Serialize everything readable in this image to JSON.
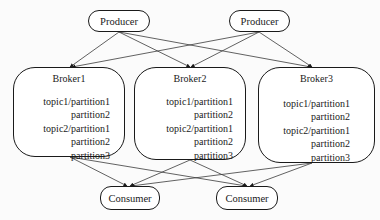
{
  "diagram": {
    "type": "kafka-architecture",
    "producers": [
      {
        "id": "p1",
        "label": "Producer"
      },
      {
        "id": "p2",
        "label": "Producer"
      }
    ],
    "brokers": [
      {
        "id": "b1",
        "label": "Broker1",
        "partitions": [
          "topic1/partition1",
          "partition2",
          "topic2/partition1",
          "partition2",
          "partition3"
        ]
      },
      {
        "id": "b2",
        "label": "Broker2",
        "partitions": [
          "topic1/partition1",
          "partition2",
          "topic2/partition1",
          "partition2",
          "partition3"
        ]
      },
      {
        "id": "b3",
        "label": "Broker3",
        "partitions": [
          "topic1/partition1",
          "partition2",
          "topic2/partition1",
          "partition2",
          "partition3"
        ]
      }
    ],
    "consumers": [
      {
        "id": "c1",
        "label": "Consumer"
      },
      {
        "id": "c2",
        "label": "Consumer"
      }
    ],
    "edges": [
      {
        "from": "p1",
        "to": "b1"
      },
      {
        "from": "p1",
        "to": "b2"
      },
      {
        "from": "p1",
        "to": "b3"
      },
      {
        "from": "p2",
        "to": "b1"
      },
      {
        "from": "p2",
        "to": "b2"
      },
      {
        "from": "p2",
        "to": "b3"
      },
      {
        "from": "b1",
        "to": "c1"
      },
      {
        "from": "b1",
        "to": "c2"
      },
      {
        "from": "b2",
        "to": "c1"
      },
      {
        "from": "b2",
        "to": "c2"
      },
      {
        "from": "b3",
        "to": "c1"
      },
      {
        "from": "b3",
        "to": "c2"
      }
    ],
    "colors": {
      "stroke": "#1a1a1a",
      "fill": "#ffffff",
      "background": "#fbfbfb"
    }
  }
}
